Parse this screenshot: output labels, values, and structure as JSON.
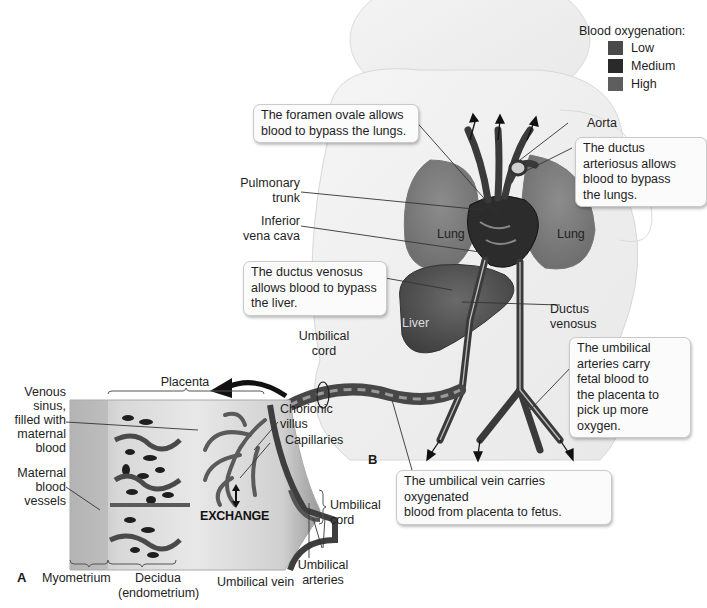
{
  "legend": {
    "title": "Blood oxygenation:",
    "items": [
      {
        "label": "Low",
        "color": "#4a4a4a"
      },
      {
        "label": "Medium",
        "color": "#2a2a2a"
      },
      {
        "label": "High",
        "color": "#5e5e5e"
      }
    ]
  },
  "panels": {
    "a": "A",
    "b": "B"
  },
  "callouts": {
    "foramen_ovale": "The foramen ovale allows blood to bypass the lungs.",
    "ductus_arteriosus": "The ductus arteriosus allows blood to bypass the lungs.",
    "ductus_venosus": "The ductus venosus allows blood to bypass the liver.",
    "umbilical_arteries": "The umbilical arteries carry fetal blood to the placenta to pick up more oxygen.",
    "umbilical_vein": "The umbilical vein carries oxygenated blood from placenta to fetus."
  },
  "callout_lines": {
    "foramen_ovale": [
      "The foramen ovale allows",
      "blood to bypass the lungs."
    ],
    "ductus_arteriosus": [
      "The ductus",
      "arteriosus allows",
      "blood to bypass",
      "the lungs."
    ],
    "ductus_venosus": [
      "The ductus venosus",
      "allows blood to bypass",
      "the liver."
    ],
    "umbilical_arteries": [
      "The umbilical",
      "arteries carry",
      "fetal blood to",
      "the placenta to",
      "pick up more",
      "oxygen."
    ],
    "umbilical_vein": [
      "The umbilical vein carries oxygenated",
      "blood from placenta to fetus."
    ]
  },
  "labels": {
    "aorta": "Aorta",
    "pulmonary_trunk": [
      "Pulmonary",
      "trunk"
    ],
    "inferior_vena_cava": [
      "Inferior",
      "vena cava"
    ],
    "lung_left": "Lung",
    "lung_right": "Lung",
    "liver": "Liver",
    "ductus_venosus": [
      "Ductus",
      "venosus"
    ],
    "umbilical_cord_top": [
      "Umbilical",
      "cord"
    ],
    "placenta": "Placenta",
    "venous_sinus": [
      "Venous",
      "sinus,",
      "filled with",
      "maternal",
      "blood"
    ],
    "maternal_vessels": [
      "Maternal",
      "blood",
      "vessels"
    ],
    "chorionic_villus": [
      "Chorionic",
      "villus"
    ],
    "capillaries": "Capillaries",
    "exchange": "EXCHANGE",
    "umbilical_cord_bottom": [
      "Umbilical",
      "cord"
    ],
    "umbilical_arteries": [
      "Umbilical",
      "arteries"
    ],
    "umbilical_vein": "Umbilical vein",
    "myometrium": "Myometrium",
    "decidua": [
      "Decidua",
      "(endometrium)"
    ]
  }
}
